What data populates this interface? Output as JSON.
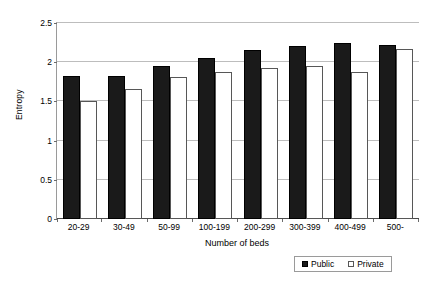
{
  "chart_data": {
    "type": "bar",
    "title": "",
    "xlabel": "Number of beds",
    "ylabel": "Entropy",
    "categories": [
      "20-29",
      "30-49",
      "50-99",
      "100-199",
      "200-299",
      "300-399",
      "400-499",
      "500-"
    ],
    "series": [
      {
        "name": "Public",
        "color": "#1a1a1a",
        "values": [
          1.82,
          1.83,
          1.95,
          2.05,
          2.16,
          2.21,
          2.24,
          2.22
        ]
      },
      {
        "name": "Private",
        "color": "#ffffff",
        "values": [
          1.5,
          1.66,
          1.81,
          1.87,
          1.92,
          1.95,
          1.88,
          2.17
        ]
      }
    ],
    "ylim": [
      0,
      2.5
    ],
    "yticks": [
      0,
      0.5,
      1,
      1.5,
      2,
      2.5
    ],
    "ytick_labels": [
      "0",
      "0.5",
      "1",
      "1.5",
      "2",
      "2.5"
    ],
    "grid": true,
    "legend_position": "bottom-right"
  }
}
